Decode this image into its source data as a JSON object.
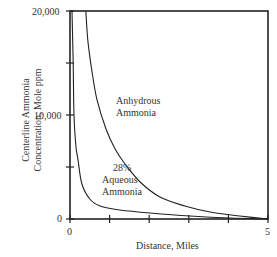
{
  "chart_data": {
    "type": "line",
    "title": "",
    "xlabel": "Distance, Miles",
    "ylabel_line1": "Centerline Ammonia",
    "ylabel_line2": "Concentration, Mole ppm",
    "xlim": [
      0,
      5
    ],
    "ylim": [
      0,
      20000
    ],
    "x_tick_labels": [
      "0",
      "5"
    ],
    "x_ticks": [
      0,
      1,
      2,
      3,
      4,
      5
    ],
    "y_tick_labels": [
      "0",
      "10,000",
      "20,000"
    ],
    "y_ticks": [
      0,
      5000,
      10000,
      15000,
      20000
    ],
    "grid": false,
    "legend": "inline annotations",
    "series": [
      {
        "name": "Anhydrous Ammonia",
        "label_line1": "Anhydrous",
        "label_line2": "Ammonia",
        "x": [
          0.4,
          0.45,
          0.55,
          0.68,
          0.91,
          1.14,
          1.39,
          1.77,
          2.27,
          2.9,
          3.54,
          4.29,
          5.0
        ],
        "y": [
          20000,
          17200,
          14300,
          11500,
          8650,
          6730,
          5290,
          3560,
          2120,
          1250,
          670,
          290,
          0
        ]
      },
      {
        "name": "28% Aqueous Ammonia",
        "label_line1": "28%",
        "label_line2": "Aqueous",
        "label_line3": "Ammonia",
        "x": [
          0.05,
          0.08,
          0.1,
          0.15,
          0.2,
          0.3,
          0.5,
          0.76,
          1.26,
          2.02,
          3.03,
          4.04,
          5.0
        ],
        "y": [
          20000,
          15000,
          10000,
          7000,
          5770,
          3370,
          1920,
          1250,
          870,
          580,
          290,
          100,
          0
        ]
      }
    ]
  }
}
